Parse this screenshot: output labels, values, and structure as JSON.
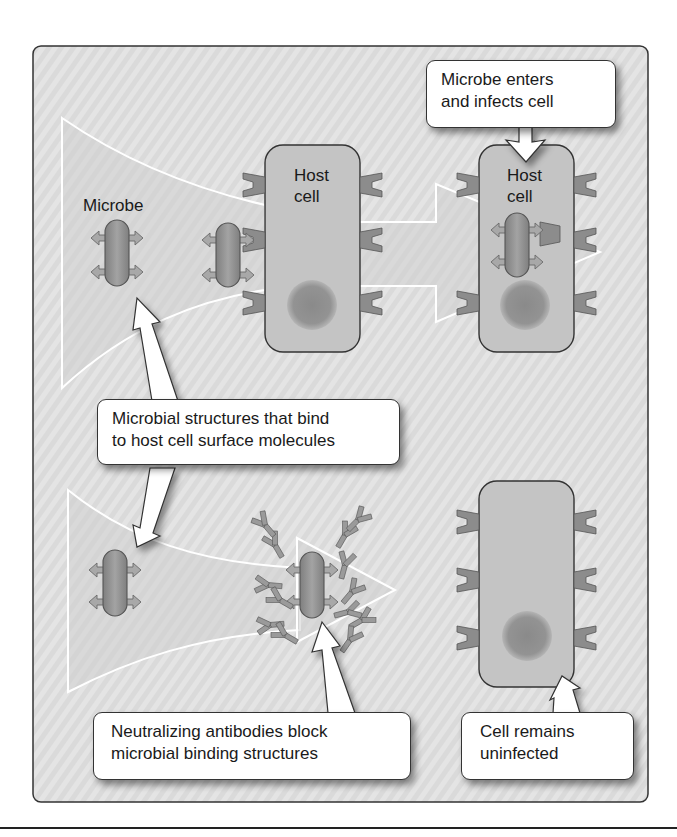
{
  "figure": {
    "panel_background": "#d9d9d9",
    "cell_fill": "#c4c4c4",
    "nucleus_fill": "#8a8a8a",
    "microbe_fill": "#8f8f8f",
    "receptor_fill": "#8c8c8c",
    "arrow_fill": "#ffffff"
  },
  "labels": {
    "microbe": "Microbe",
    "host_cell_1": [
      "Host",
      "cell"
    ],
    "host_cell_2": [
      "Host",
      "cell"
    ]
  },
  "callouts": {
    "enters": [
      "Microbe enters",
      "and infects cell"
    ],
    "structures": [
      "Microbial structures that bind",
      "to host cell surface molecules"
    ],
    "antibodies": [
      "Neutralizing antibodies block",
      "microbial binding structures"
    ],
    "uninfected": [
      "Cell remains",
      "uninfected"
    ]
  }
}
